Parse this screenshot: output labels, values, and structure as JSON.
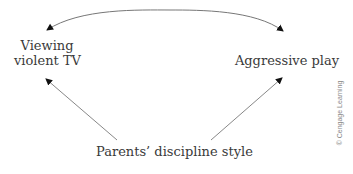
{
  "diagram": {
    "type": "path-diagram",
    "nodes": {
      "viewing_tv": {
        "line1": "Viewing",
        "line2": "violent TV"
      },
      "aggressive_play": {
        "label": "Aggressive play"
      },
      "parents_style": {
        "label": "Parents’ discipline style"
      }
    },
    "edges": [
      {
        "from": "viewing_tv",
        "to": "aggressive_play",
        "style": "curved-bidirectional"
      },
      {
        "from": "parents_style",
        "to": "viewing_tv",
        "style": "straight-arrow"
      },
      {
        "from": "parents_style",
        "to": "aggressive_play",
        "style": "straight-arrow"
      }
    ],
    "colors": {
      "line": "#777777",
      "arrowhead": "#111111",
      "text": "#3a3a3a"
    },
    "credit": "© Cengage Learning"
  }
}
